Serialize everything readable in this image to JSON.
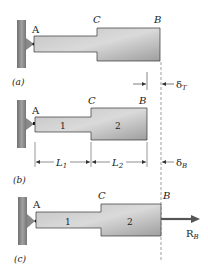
{
  "figure": {
    "panels": [
      {
        "id": "a",
        "caption": "(a)",
        "points": {
          "A": "A",
          "C": "C",
          "B": "B"
        },
        "dimension": {
          "symbol": "δ",
          "subscript": "T"
        }
      },
      {
        "id": "b",
        "caption": "(b)",
        "points": {
          "A": "A",
          "C": "C",
          "B": "B"
        },
        "segments": [
          "1",
          "2"
        ],
        "lengths": [
          {
            "symbol": "L",
            "subscript": "1"
          },
          {
            "symbol": "L",
            "subscript": "2"
          }
        ],
        "dimension": {
          "symbol": "δ",
          "subscript": "B"
        }
      },
      {
        "id": "c",
        "caption": "(c)",
        "points": {
          "A": "A",
          "C": "C",
          "B": "B"
        },
        "segments": [
          "1",
          "2"
        ],
        "force": {
          "symbol": "R",
          "subscript": "B"
        }
      }
    ],
    "colors": {
      "bar_fill": "#a9a9a9",
      "bar_stroke": "#333333",
      "wall": "#8a8a8a",
      "force_arrow": "#555555"
    }
  }
}
